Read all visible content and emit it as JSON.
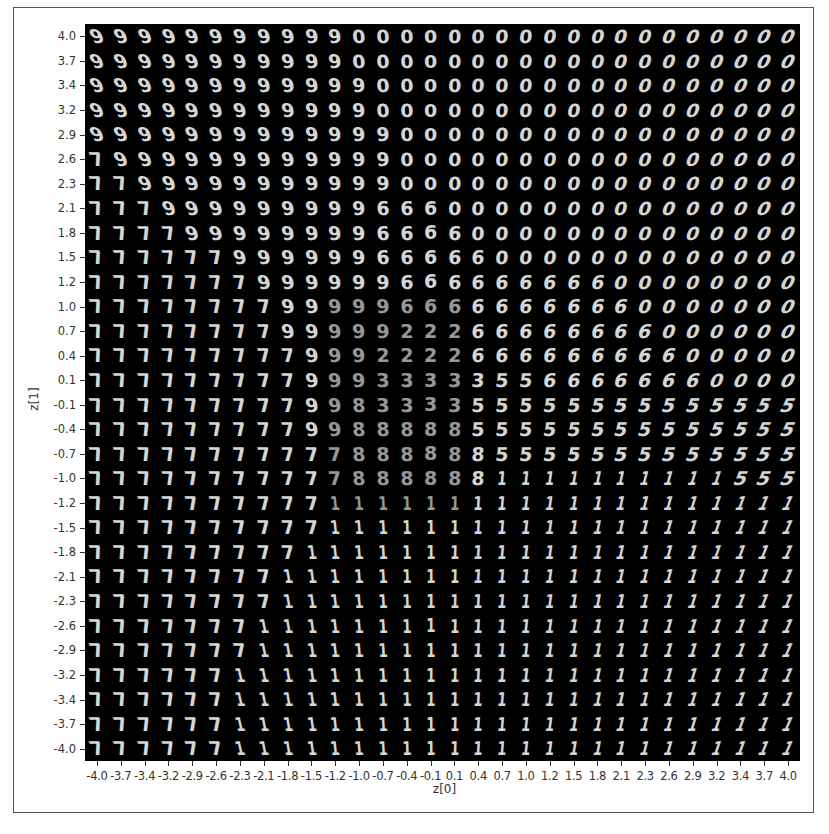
{
  "chart_data": {
    "type": "heatmap",
    "title": "",
    "xlabel": "z[0]",
    "ylabel": "z[1]",
    "xlim": [
      -4.0,
      4.0
    ],
    "ylim": [
      -4.0,
      4.0
    ],
    "grid": false,
    "legend": null,
    "grid_size": [
      30,
      30
    ],
    "x_ticks": [
      "-4.0",
      "-3.7",
      "-3.4",
      "-3.2",
      "-2.9",
      "-2.6",
      "-2.3",
      "-2.1",
      "-1.8",
      "-1.5",
      "-1.2",
      "-1.0",
      "-0.7",
      "-0.4",
      "-0.1",
      "0.1",
      "0.4",
      "0.7",
      "1.0",
      "1.2",
      "1.5",
      "1.8",
      "2.1",
      "2.3",
      "2.6",
      "2.9",
      "3.2",
      "3.4",
      "3.7",
      "4.0"
    ],
    "y_ticks": [
      "4.0",
      "3.7",
      "3.4",
      "3.2",
      "2.9",
      "2.6",
      "2.3",
      "2.1",
      "1.8",
      "1.5",
      "1.2",
      "1.0",
      "0.7",
      "0.4",
      "0.1",
      "-0.1",
      "-0.4",
      "-0.7",
      "-1.0",
      "-1.2",
      "-1.5",
      "-1.8",
      "-2.1",
      "-2.3",
      "-2.6",
      "-2.9",
      "-3.2",
      "-3.4",
      "-3.7",
      "-4.0"
    ],
    "digit_map_rows_top_to_bottom": [
      "999999999990000000000000000000",
      "999999999990000000000000000000",
      "999999999999000000000000000000",
      "999999999999000000000000000000",
      "999999999999900000000000000000",
      "799999999999900000000000000000",
      "779999999999900000000000000000",
      "777999999999666000000000000000",
      "777799999999666600000000000000",
      "777777999999666660000000000000",
      "777777799999966666666600000000",
      "777777779999966666666660000000",
      "777777779999922266666666000000",
      "777777777999222266666666600000",
      "777777777999333335566666660000",
      "777777777998333355555555555555",
      "777777777998888855555555555555",
      "777777777778888885555555555555",
      "777777777778888881111111111555",
      "777777777711111111111111111111",
      "777777777711111111111111111111",
      "777777777111111111111111111111",
      "777777771111111111111111111111",
      "777777771111111111111111111111",
      "777777711111111111111111111111",
      "777777711111111111111111111111",
      "777777111111111111111111111111",
      "777777111111111111111111111111",
      "777777111111111111111111111111",
      "777777111111111111111111111111"
    ]
  }
}
